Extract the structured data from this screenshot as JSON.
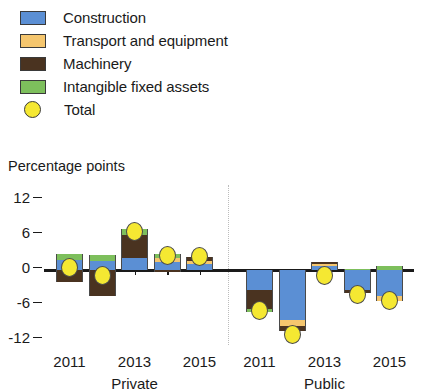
{
  "legend": {
    "items": [
      {
        "label": "Construction",
        "color": "#5B8FD4",
        "shape": "square",
        "icon": "construction-swatch-icon"
      },
      {
        "label": "Transport and equipment",
        "color": "#F5C66E",
        "shape": "square",
        "icon": "transport-swatch-icon"
      },
      {
        "label": "Machinery",
        "color": "#4A3320",
        "shape": "square",
        "icon": "machinery-swatch-icon"
      },
      {
        "label": "Intangible fixed assets",
        "color": "#7DBF5C",
        "shape": "square",
        "icon": "intangible-swatch-icon"
      },
      {
        "label": "Total",
        "color": "#F5E832",
        "shape": "circle",
        "icon": "total-marker-icon"
      }
    ]
  },
  "axis_title": "Percentage points",
  "group_labels": [
    "Private",
    "Public"
  ],
  "chart_data": {
    "type": "bar",
    "subtype": "stacked-bar-with-total-marker",
    "title": "",
    "xlabel": "",
    "ylabel": "Percentage points",
    "ylim": [
      -12,
      12
    ],
    "yticks": [
      12,
      6,
      0,
      -6,
      -12
    ],
    "ytick_labels": [
      "12",
      "6",
      "0",
      "-6",
      "-12"
    ],
    "grid": false,
    "legend_position": "top-left",
    "groups": [
      {
        "name": "Private",
        "categories": [
          "2011",
          "2012",
          "2013",
          "2014",
          "2015"
        ],
        "tick_labels": [
          "2011",
          "",
          "2013",
          "",
          "2015"
        ],
        "series": [
          {
            "name": "Construction",
            "color": "#5B8FD4",
            "values": [
              1.7,
              1.5,
              2.0,
              1.3,
              1.0
            ]
          },
          {
            "name": "Transport and equipment",
            "color": "#F5C66E",
            "values": [
              0.0,
              0.0,
              0.0,
              0.7,
              0.5
            ]
          },
          {
            "name": "Machinery",
            "color": "#4A3320",
            "values": [
              -2.0,
              -4.5,
              4.0,
              -0.4,
              0.8
            ]
          },
          {
            "name": "Intangible fixed assets",
            "color": "#7DBF5C",
            "values": [
              1.0,
              1.0,
              1.0,
              0.7,
              0.0
            ]
          }
        ],
        "total": [
          0.5,
          -1.0,
          6.5,
          2.5,
          2.3
        ]
      },
      {
        "name": "Public",
        "categories": [
          "2011",
          "2012",
          "2013",
          "2014",
          "2015"
        ],
        "tick_labels": [
          "2011",
          "",
          "2013",
          "",
          "2015"
        ],
        "series": [
          {
            "name": "Construction",
            "color": "#5B8FD4",
            "values": [
              -3.5,
              -8.5,
              0.7,
              -3.5,
              -4.5
            ]
          },
          {
            "name": "Transport and equipment",
            "color": "#F5C66E",
            "values": [
              0.0,
              -1.0,
              0.3,
              0.0,
              -0.8
            ]
          },
          {
            "name": "Machinery",
            "color": "#4A3320",
            "values": [
              -3.2,
              -1.0,
              0.3,
              -0.5,
              0.0
            ]
          },
          {
            "name": "Intangible fixed assets",
            "color": "#7DBF5C",
            "values": [
              -0.4,
              0.0,
              0.0,
              0.2,
              0.6
            ]
          }
        ],
        "total": [
          -7.0,
          -11.0,
          -1.0,
          -4.2,
          -5.2
        ]
      }
    ]
  }
}
